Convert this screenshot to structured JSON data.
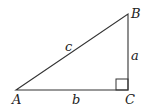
{
  "diagram": {
    "type": "right-triangle",
    "vertices": {
      "A": {
        "label": "A",
        "x": 16,
        "y": 90
      },
      "B": {
        "label": "B",
        "x": 128,
        "y": 14
      },
      "C": {
        "label": "C",
        "x": 128,
        "y": 90
      }
    },
    "sides": {
      "a": {
        "label": "a",
        "between": [
          "B",
          "C"
        ]
      },
      "b": {
        "label": "b",
        "between": [
          "A",
          "C"
        ]
      },
      "c": {
        "label": "c",
        "between": [
          "A",
          "B"
        ]
      }
    },
    "right_angle_at": "C",
    "colors": {
      "line": "#333333",
      "text": "#222222"
    }
  }
}
